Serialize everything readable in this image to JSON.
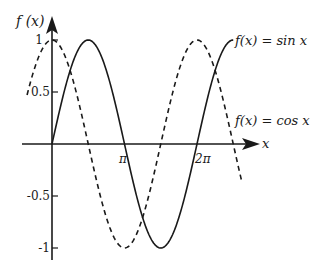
{
  "chart_data": {
    "type": "line",
    "title": "",
    "xlabel": "x",
    "ylabel": "f(x)",
    "x_ticks": [
      {
        "label": "π",
        "value": 3.14159
      },
      {
        "label": "2π",
        "value": 6.28319
      }
    ],
    "y_ticks": [
      {
        "label": "1",
        "value": 1
      },
      {
        "label": "0.5",
        "value": 0.5
      },
      {
        "label": "-0.5",
        "value": -0.5
      },
      {
        "label": "-1",
        "value": -1
      }
    ],
    "xlim": [
      -1.08,
      8.23
    ],
    "ylim": [
      -1,
      1
    ],
    "grid": false,
    "series": [
      {
        "name": "f(x) = sin x",
        "style": "solid",
        "x_range": [
          0,
          7.854
        ],
        "points": [
          [
            0,
            0
          ],
          [
            1.5708,
            1
          ],
          [
            3.1416,
            0
          ],
          [
            4.7124,
            -1
          ],
          [
            6.2832,
            0
          ],
          [
            7.854,
            1
          ]
        ]
      },
      {
        "name": "f(x) = cos x",
        "style": "dashed",
        "x_range": [
          -1.08,
          8.23
        ],
        "points": [
          [
            0,
            1
          ],
          [
            1.5708,
            0
          ],
          [
            3.1416,
            -1
          ],
          [
            4.7124,
            0
          ],
          [
            6.2832,
            1
          ]
        ]
      }
    ],
    "annotations": [
      {
        "text": "f(x) = sin x",
        "position": "end of solid curve, upper right"
      },
      {
        "text": "f(x) = cos x",
        "position": "right side, above x-axis"
      }
    ]
  },
  "labels": {
    "y_axis": "f (x)",
    "x_axis": "x",
    "pi": "π",
    "two_pi": "2π",
    "y1": "1",
    "y05": "0.5",
    "ym05": "-0.5",
    "ym1": "-1",
    "sin_label": "f(x) = sin x",
    "cos_label": "f(x) = cos x"
  },
  "colors": {
    "line": "#1a1a1a",
    "background": "#ffffff"
  }
}
